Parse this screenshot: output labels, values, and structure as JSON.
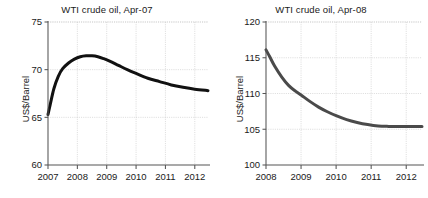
{
  "figure": {
    "panels": [
      "left",
      "right"
    ]
  },
  "chart_data": [
    {
      "type": "line",
      "panel": "left",
      "title": "WTI crude oil, Apr-07",
      "xlabel": "",
      "ylabel": "US$/Barrel",
      "ylim": [
        60,
        75
      ],
      "xlim": [
        2007,
        2012.45
      ],
      "yticks": [
        60,
        65,
        70,
        75
      ],
      "ytick_labels": [
        "60",
        "65",
        "70",
        "75"
      ],
      "xticks": [
        2007,
        2008,
        2009,
        2010,
        2011,
        2012
      ],
      "xtick_labels": [
        "2007",
        "2008",
        "2009",
        "2010",
        "2011",
        "2012"
      ],
      "grid": true,
      "legend": "none",
      "line_color": "#111111",
      "line_width": 3.0,
      "x": [
        2007.0,
        2007.08,
        2007.2,
        2007.35,
        2007.5,
        2007.7,
        2007.9,
        2008.1,
        2008.3,
        2008.5,
        2008.7,
        2008.9,
        2009.1,
        2009.4,
        2009.7,
        2010.0,
        2010.4,
        2010.8,
        2011.2,
        2011.6,
        2012.0,
        2012.45
      ],
      "values": [
        65.3,
        66.4,
        68.0,
        69.3,
        70.1,
        70.7,
        71.1,
        71.35,
        71.45,
        71.45,
        71.35,
        71.15,
        70.9,
        70.45,
        70.0,
        69.6,
        69.1,
        68.75,
        68.4,
        68.15,
        67.95,
        67.8
      ]
    },
    {
      "type": "line",
      "panel": "right",
      "title": "WTI crude oil, Apr-08",
      "xlabel": "",
      "ylabel": "US$/Barrel",
      "ylim": [
        100,
        120
      ],
      "xlim": [
        2008,
        2012.45
      ],
      "yticks": [
        100,
        105,
        110,
        115,
        120
      ],
      "ytick_labels": [
        "100",
        "105",
        "110",
        "115",
        "120"
      ],
      "xticks": [
        2008,
        2009,
        2010,
        2011,
        2012
      ],
      "xtick_labels": [
        "2008",
        "2009",
        "2010",
        "2011",
        "2012"
      ],
      "grid": true,
      "legend": "none",
      "line_color": "#4a4a4a",
      "line_width": 3.0,
      "x": [
        2008.0,
        2008.1,
        2008.25,
        2008.45,
        2008.65,
        2008.85,
        2009.0,
        2009.25,
        2009.5,
        2009.75,
        2010.0,
        2010.3,
        2010.6,
        2010.9,
        2011.2,
        2011.5,
        2011.8,
        2012.1,
        2012.45
      ],
      "values": [
        116.1,
        115.2,
        113.8,
        112.3,
        111.1,
        110.3,
        109.8,
        108.9,
        108.1,
        107.45,
        106.9,
        106.35,
        105.95,
        105.65,
        105.45,
        105.4,
        105.4,
        105.4,
        105.4
      ]
    }
  ]
}
